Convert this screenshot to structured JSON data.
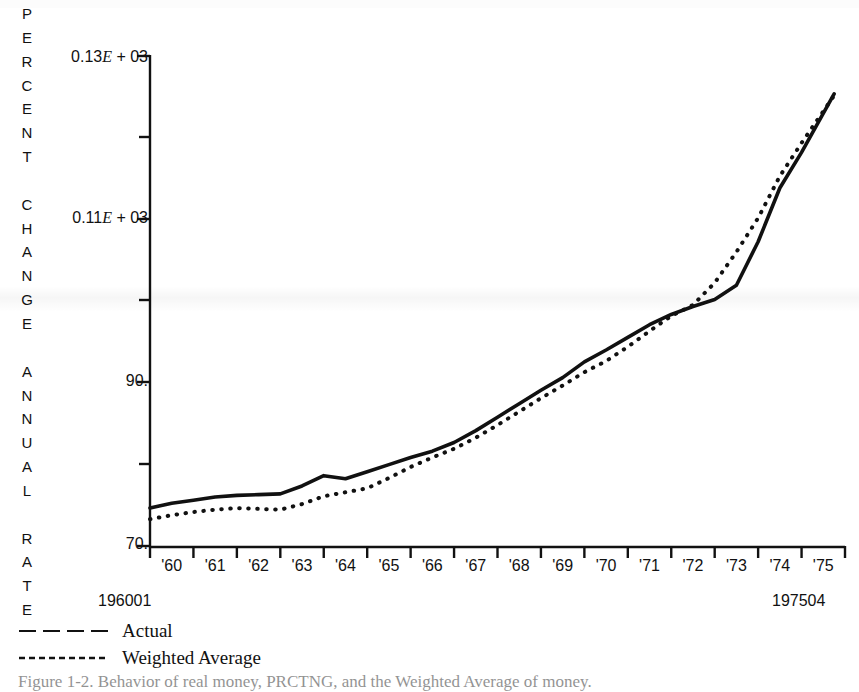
{
  "figure": {
    "y_axis_title": "PERCENT CHANGE ANNUAL RATE",
    "y_axis_title_chars": [
      "P",
      "E",
      "R",
      "C",
      "E",
      "N",
      "T",
      "",
      "C",
      "H",
      "A",
      "N",
      "G",
      "E",
      "",
      "A",
      "N",
      "N",
      "U",
      "A",
      "L",
      "",
      "R",
      "A",
      "T",
      "E"
    ],
    "range_start_label": "196001",
    "range_end_label": "197504",
    "caption": "Figure 1-2.  Behavior of real money, PRCTNG, and the Weighted Average of money."
  },
  "legend": {
    "position": "below-axis-left",
    "items": [
      {
        "label": "Actual",
        "style": "long-dash",
        "color": "#111111"
      },
      {
        "label": "Weighted Average",
        "style": "dotted",
        "color": "#111111"
      }
    ]
  },
  "chart_data": {
    "type": "line",
    "title": "",
    "subtitle": "",
    "xlabel": "",
    "ylabel": "PERCENT CHANGE ANNUAL RATE",
    "grid": false,
    "legend_position": "bottom-left",
    "x_tick_labels": [
      "'60",
      "'61",
      "'62",
      "'63",
      "'64",
      "'65",
      "'66",
      "'67",
      "'68",
      "'69",
      "'70",
      "'71",
      "'72",
      "'73",
      "'74",
      "'75"
    ],
    "x_range_labels": {
      "start": "196001",
      "end": "197504"
    },
    "xlim": [
      1960.0,
      1976.0
    ],
    "ylim": [
      70,
      132
    ],
    "y_major_ticks": [
      {
        "value": 70,
        "label": "70."
      },
      {
        "value": 90,
        "label": "90."
      },
      {
        "value": 110,
        "label": "0.11E + 03"
      },
      {
        "value": 130,
        "label": "0.13E + 03"
      }
    ],
    "y_minor_ticks": [
      80,
      100,
      120
    ],
    "x": [
      1960.0,
      1960.5,
      1961.0,
      1961.5,
      1962.0,
      1962.5,
      1963.0,
      1963.5,
      1964.0,
      1964.5,
      1965.0,
      1965.5,
      1966.0,
      1966.5,
      1967.0,
      1967.5,
      1968.0,
      1968.5,
      1969.0,
      1969.5,
      1970.0,
      1970.5,
      1971.0,
      1971.5,
      1972.0,
      1972.5,
      1973.0,
      1973.5,
      1974.0,
      1974.5,
      1975.0,
      1975.75
    ],
    "series": [
      {
        "name": "Actual",
        "style": "solid",
        "color": "#111111",
        "values": [
          74.8,
          75.4,
          75.8,
          76.2,
          76.4,
          76.5,
          76.6,
          77.6,
          78.9,
          78.5,
          79.4,
          80.3,
          81.2,
          82.0,
          83.1,
          84.6,
          86.3,
          88.0,
          89.7,
          91.3,
          93.3,
          94.8,
          96.4,
          98.0,
          99.3,
          100.3,
          101.2,
          103.0,
          108.5,
          115.3,
          119.8,
          127.2
        ]
      },
      {
        "name": "Weighted Average",
        "style": "dotted",
        "color": "#111111",
        "values": [
          73.4,
          73.9,
          74.3,
          74.6,
          74.8,
          74.7,
          74.6,
          75.3,
          76.3,
          76.8,
          77.3,
          78.6,
          80.0,
          81.2,
          82.3,
          83.7,
          85.3,
          87.0,
          88.7,
          90.3,
          92.0,
          93.4,
          95.2,
          97.2,
          99.1,
          100.5,
          103.3,
          107.2,
          111.5,
          116.8,
          121.0,
          127.0
        ]
      }
    ]
  }
}
